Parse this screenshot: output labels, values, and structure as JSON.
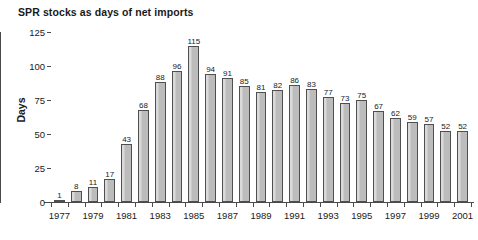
{
  "chart_data": {
    "type": "bar",
    "title": "SPR stocks as days of net imports",
    "xlabel": "",
    "ylabel": "Days",
    "ylim": [
      0,
      125
    ],
    "yticks": [
      0,
      25,
      50,
      75,
      100,
      125
    ],
    "grid": false,
    "legend": null,
    "categories": [
      "1977",
      "1978",
      "1979",
      "1980",
      "1981",
      "1982",
      "1983",
      "1984",
      "1985",
      "1986",
      "1987",
      "1988",
      "1989",
      "1990",
      "1991",
      "1992",
      "1993",
      "1994",
      "1995",
      "1996",
      "1997",
      "1998",
      "1999",
      "2000",
      "2001"
    ],
    "values": [
      1,
      8,
      11,
      17,
      43,
      68,
      88,
      96,
      115,
      94,
      91,
      85,
      81,
      82,
      86,
      83,
      77,
      73,
      75,
      67,
      62,
      59,
      57,
      52,
      52
    ],
    "xtick_labels": [
      "1977",
      "1979",
      "1981",
      "1983",
      "1985",
      "1987",
      "1989",
      "1991",
      "1993",
      "1995",
      "1997",
      "1999",
      "2001"
    ],
    "bar_color": "#bcbcbc",
    "bar_edge_color": "#4f4f4f",
    "axis_color": "#4a4a4a",
    "text_color": "#1a1a1a",
    "background": "#ffffff"
  }
}
